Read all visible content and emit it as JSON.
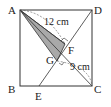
{
  "diagram": {
    "type": "geometry-square",
    "points": {
      "A": {
        "label": "A",
        "x": 20,
        "y": 10
      },
      "B": {
        "label": "B",
        "x": 20,
        "y": 86
      },
      "C": {
        "label": "C",
        "x": 92,
        "y": 86
      },
      "D": {
        "label": "D",
        "x": 92,
        "y": 10
      },
      "E": {
        "label": "E",
        "x": 39,
        "y": 86
      },
      "F": {
        "label": "F",
        "x": 65,
        "y": 44
      },
      "G": {
        "label": "G",
        "x": 57,
        "y": 61
      }
    },
    "measurements": {
      "AF": "12 cm",
      "GC": "9 cm"
    },
    "colors": {
      "stroke": "#333333",
      "shade": "#a9a9a9"
    }
  }
}
